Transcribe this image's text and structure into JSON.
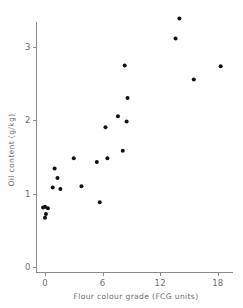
{
  "chart_data": {
    "type": "scatter",
    "title": "",
    "xlabel": "Flour colour grade (FCG units)",
    "ylabel": "Oil content  (g/kg)",
    "xlim": [
      -1.5,
      20.5
    ],
    "ylim": [
      0,
      3.55
    ],
    "xticks": [
      0,
      6,
      12,
      18
    ],
    "xtick_labels": [
      "0",
      "6",
      "12",
      "18"
    ],
    "yticks": [
      0,
      1,
      2,
      3
    ],
    "ytick_labels": [
      "0",
      "1",
      "2",
      "3"
    ],
    "grid": false,
    "legend": "none",
    "marker": "filled-circle",
    "marker_color": "#111111",
    "axis_color": "#8a8a8a",
    "points": [
      {
        "x": -0.2,
        "y": 0.81
      },
      {
        "x": 0.0,
        "y": 0.82
      },
      {
        "x": 0.3,
        "y": 0.8
      },
      {
        "x": 0.1,
        "y": 0.72
      },
      {
        "x": 0.0,
        "y": 0.67
      },
      {
        "x": 0.8,
        "y": 1.08
      },
      {
        "x": 1.0,
        "y": 1.34
      },
      {
        "x": 1.3,
        "y": 1.21
      },
      {
        "x": 1.6,
        "y": 1.06
      },
      {
        "x": 3.0,
        "y": 1.48
      },
      {
        "x": 3.8,
        "y": 1.1
      },
      {
        "x": 5.4,
        "y": 1.43
      },
      {
        "x": 5.7,
        "y": 0.88
      },
      {
        "x": 6.3,
        "y": 1.9
      },
      {
        "x": 6.5,
        "y": 1.48
      },
      {
        "x": 7.6,
        "y": 2.05
      },
      {
        "x": 8.1,
        "y": 1.58
      },
      {
        "x": 8.3,
        "y": 2.74
      },
      {
        "x": 8.5,
        "y": 1.98
      },
      {
        "x": 8.6,
        "y": 2.3
      },
      {
        "x": 13.6,
        "y": 3.11
      },
      {
        "x": 14.0,
        "y": 3.38
      },
      {
        "x": 15.5,
        "y": 2.55
      },
      {
        "x": 18.3,
        "y": 2.73
      }
    ]
  },
  "axes": {
    "x_title": "Flour colour grade (FCG units)",
    "y_title": "Oil content  (g/kg)"
  }
}
